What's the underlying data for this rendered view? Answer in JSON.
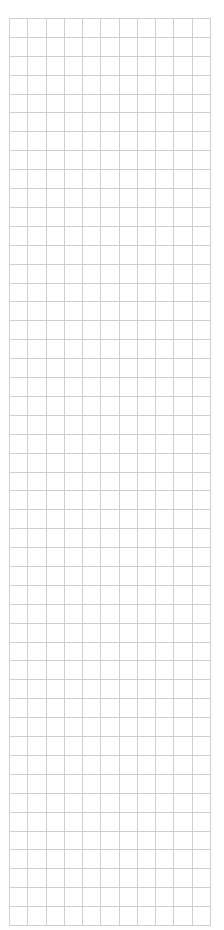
{
  "grid": {
    "columns": 11,
    "rows": 48,
    "line_color": "#cfcfcf",
    "background": "#ffffff"
  }
}
